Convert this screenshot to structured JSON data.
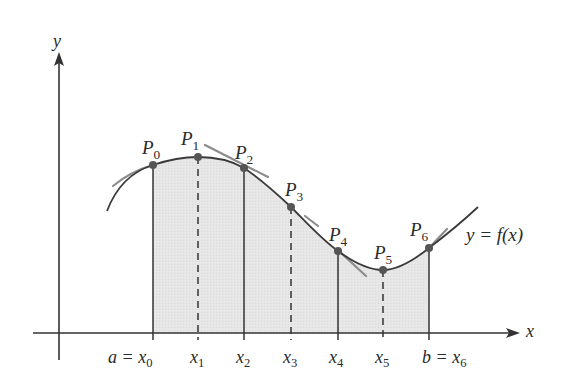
{
  "diagram": {
    "axes": {
      "x_label": "x",
      "y_label": "y"
    },
    "curve_label": "y = f(x)",
    "points": [
      {
        "name": "P",
        "sub": "0"
      },
      {
        "name": "P",
        "sub": "1"
      },
      {
        "name": "P",
        "sub": "2"
      },
      {
        "name": "P",
        "sub": "3"
      },
      {
        "name": "P",
        "sub": "4"
      },
      {
        "name": "P",
        "sub": "5"
      },
      {
        "name": "P",
        "sub": "6"
      }
    ],
    "ticks": [
      {
        "prefix": "a = ",
        "var": "x",
        "sub": "0"
      },
      {
        "prefix": "",
        "var": "x",
        "sub": "1"
      },
      {
        "prefix": "",
        "var": "x",
        "sub": "2"
      },
      {
        "prefix": "",
        "var": "x",
        "sub": "3"
      },
      {
        "prefix": "",
        "var": "x",
        "sub": "4"
      },
      {
        "prefix": "",
        "var": "x",
        "sub": "5"
      },
      {
        "prefix": "b = ",
        "var": "x",
        "sub": "6"
      }
    ],
    "colors": {
      "curve": "#3a3a3a",
      "tangent": "#8a8a8a",
      "shade": "#e4e4e4",
      "axis": "#333333",
      "point": "#555555"
    }
  }
}
